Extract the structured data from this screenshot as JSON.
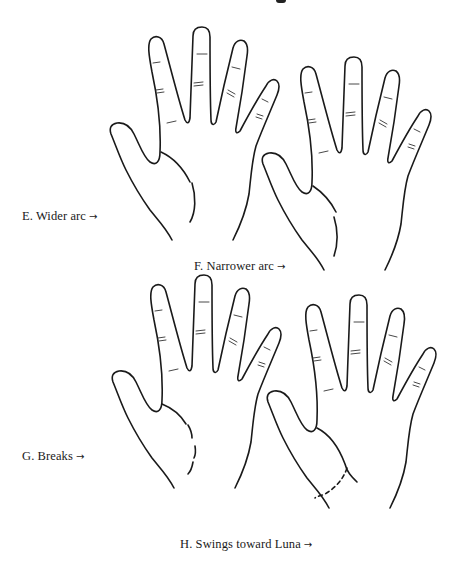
{
  "figure": {
    "type": "palmistry-illustration",
    "panels": [
      {
        "id": "E",
        "label": "E.  Wider arc",
        "arrow": "→",
        "life_line_style": "wide-arc"
      },
      {
        "id": "F",
        "label": "F. Narrower arc",
        "arrow": "→",
        "life_line_style": "narrow-arc"
      },
      {
        "id": "G",
        "label": "G.  Breaks",
        "arrow": "→",
        "life_line_style": "broken"
      },
      {
        "id": "H",
        "label": "H. Swings toward Luna",
        "arrow": "→",
        "life_line_style": "dashed-swing"
      }
    ]
  },
  "colors": {
    "ink": "#1a1a1a",
    "background": "#ffffff"
  }
}
